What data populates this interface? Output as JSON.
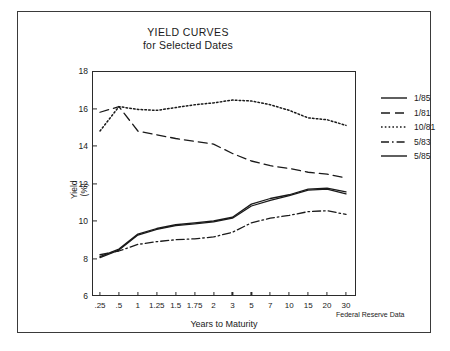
{
  "title": {
    "line1": "YIELD CURVES",
    "line2": "for Selected Dates"
  },
  "axes": {
    "ylabel_line1": "Yield",
    "ylabel_line2": "(%)",
    "xlabel": "Years to Maturity"
  },
  "source_note": "Federal Reserve Data",
  "legend": {
    "position": "right",
    "items": [
      {
        "label": "1/85",
        "style": "solid"
      },
      {
        "label": "1/81",
        "style": "dashed"
      },
      {
        "label": "10/81",
        "style": "dotted"
      },
      {
        "label": "5/83",
        "style": "dashdot"
      },
      {
        "label": "5/85",
        "style": "solid"
      }
    ]
  },
  "chart_data": {
    "type": "line",
    "title": "YIELD CURVES for Selected Dates",
    "xlabel": "Years to Maturity",
    "ylabel": "Yield (%)",
    "categories": [
      ".25",
      ".5",
      "1",
      "1.25",
      "1.5",
      "1.75",
      "2",
      "3",
      "5",
      "7",
      "10",
      "15",
      "20",
      "30"
    ],
    "ylim": [
      6,
      18
    ],
    "yticks": [
      6,
      8,
      10,
      12,
      14,
      16,
      18
    ],
    "grid": false,
    "legend_position": "right",
    "annotations": [
      "Federal Reserve Data"
    ],
    "series": [
      {
        "name": "1/85",
        "style": "solid",
        "values": [
          8.1,
          8.5,
          9.3,
          9.6,
          9.8,
          9.9,
          10.0,
          10.2,
          10.9,
          11.2,
          11.4,
          11.7,
          11.75,
          11.55
        ]
      },
      {
        "name": "1/81",
        "style": "dashed",
        "values": [
          15.8,
          16.1,
          14.8,
          14.6,
          14.4,
          14.25,
          14.1,
          13.6,
          13.2,
          12.95,
          12.8,
          12.6,
          12.5,
          12.3
        ]
      },
      {
        "name": "10/81",
        "style": "dotted",
        "values": [
          14.8,
          16.1,
          15.95,
          15.9,
          16.05,
          16.2,
          16.3,
          16.45,
          16.4,
          16.2,
          15.9,
          15.5,
          15.4,
          15.1
        ]
      },
      {
        "name": "5/83",
        "style": "dashdot",
        "values": [
          8.2,
          8.4,
          8.75,
          8.9,
          9.0,
          9.05,
          9.15,
          9.4,
          9.9,
          10.15,
          10.3,
          10.5,
          10.55,
          10.35
        ]
      },
      {
        "name": "5/85",
        "style": "solid",
        "values": [
          8.05,
          8.45,
          9.25,
          9.55,
          9.75,
          9.85,
          9.95,
          10.15,
          10.8,
          11.1,
          11.35,
          11.65,
          11.7,
          11.45
        ]
      }
    ]
  }
}
